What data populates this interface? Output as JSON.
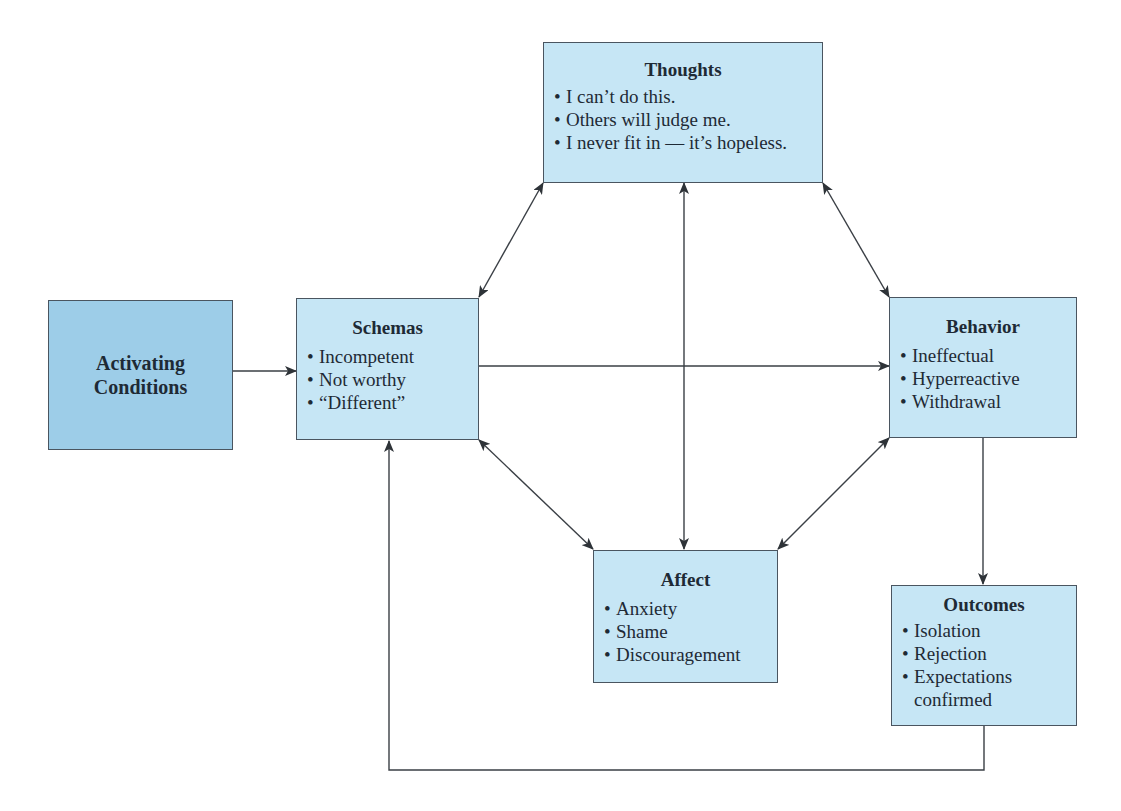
{
  "diagram": {
    "colors": {
      "activating_fill": "#9dcde8",
      "box_fill": "#c6e6f5",
      "line": "#3a3f45"
    },
    "boxes": {
      "activating": {
        "title_line1": "Activating",
        "title_line2": "Conditions"
      },
      "thoughts": {
        "title": "Thoughts",
        "items": [
          "I can’t do this.",
          "Others will judge me.",
          "I never fit in — it’s hopeless."
        ]
      },
      "schemas": {
        "title": "Schemas",
        "items": [
          "Incompetent",
          "Not worthy",
          "“Different”"
        ]
      },
      "behavior": {
        "title": "Behavior",
        "items": [
          "Ineffectual",
          "Hyperreactive",
          "Withdrawal"
        ]
      },
      "affect": {
        "title": "Affect",
        "items": [
          "Anxiety",
          "Shame",
          "Discouragement"
        ]
      },
      "outcomes": {
        "title": "Outcomes",
        "items": [
          "Isolation",
          "Rejection",
          "Expectations"
        ],
        "item3_continuation": "confirmed"
      }
    },
    "bullet": "•",
    "connections": [
      {
        "from": "activating",
        "to": "schemas",
        "type": "one-way"
      },
      {
        "from": "schemas",
        "to": "behavior",
        "type": "one-way"
      },
      {
        "from": "schemas",
        "to": "thoughts",
        "type": "two-way"
      },
      {
        "from": "thoughts",
        "to": "behavior",
        "type": "two-way"
      },
      {
        "from": "thoughts",
        "to": "affect",
        "type": "two-way"
      },
      {
        "from": "schemas",
        "to": "affect",
        "type": "two-way"
      },
      {
        "from": "behavior",
        "to": "affect",
        "type": "two-way"
      },
      {
        "from": "behavior",
        "to": "outcomes",
        "type": "one-way"
      },
      {
        "from": "outcomes",
        "to": "schemas",
        "type": "one-way-feedback"
      }
    ]
  }
}
